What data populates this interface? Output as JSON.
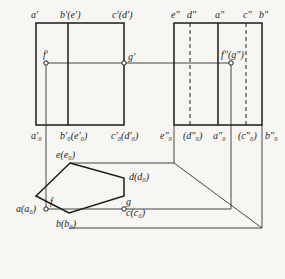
{
  "diagram": {
    "type": "orthographic-projection",
    "colors": {
      "line": "#1a1a1a",
      "thin": "#555555",
      "background": "#f7f6f3"
    },
    "front_view": {
      "top_labels": {
        "a": "a′",
        "b": "b′(e′)",
        "c": "c′(d′)"
      },
      "bottom_labels": {
        "a": "a′₀",
        "b": "b′₀(e′₀)",
        "c": "c′₀(d′₀)"
      },
      "points": {
        "f": "f′",
        "g": "g′"
      }
    },
    "side_view": {
      "top_labels": {
        "e": "e″",
        "d": "d″",
        "a": "a″",
        "c": "c″",
        "b": "b″"
      },
      "bottom_labels": {
        "e": "e″₀",
        "d": "(d″₀)",
        "a": "a″₀",
        "c": "(c″₀)",
        "b": "b″₀"
      },
      "points": {
        "fg": "f″(g″)"
      }
    },
    "top_view": {
      "vertices": {
        "e": "e(e₀)",
        "d": "d(d₀)",
        "c": "c(c₀)",
        "b": "b(b₀)",
        "a": "a(a₀)"
      },
      "points": {
        "f": "f",
        "g": "g"
      }
    }
  }
}
